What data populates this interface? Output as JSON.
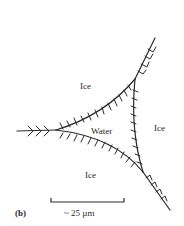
{
  "figure": {
    "panel_label": "(b)",
    "regions": {
      "ice_top": "Ice",
      "water": "Water",
      "ice_right": "Ice",
      "ice_bottom": "Ice"
    },
    "scale_bar": {
      "label": "~ 25 µm"
    },
    "colors": {
      "line": "#2a2a2a",
      "background": "#ffffff"
    }
  }
}
